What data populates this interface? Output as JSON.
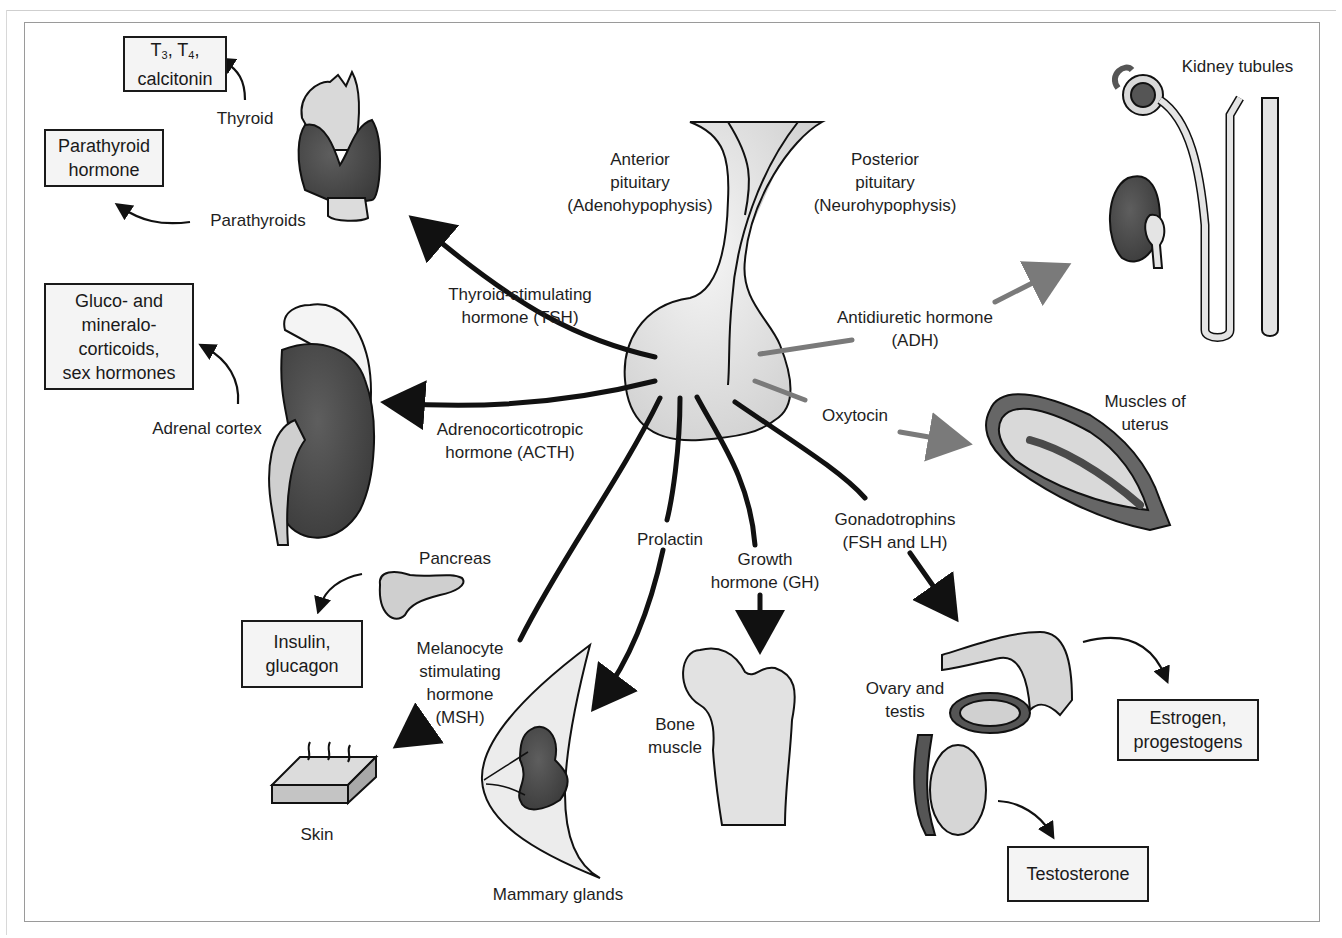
{
  "diagram": {
    "center": {
      "anterior": {
        "line1": "Anterior",
        "line2": "pituitary",
        "line3": "(Adenohypophysis)"
      },
      "posterior": {
        "line1": "Posterior",
        "line2": "pituitary",
        "line3": "(Neurohypophysis)"
      }
    },
    "hormones": {
      "tsh": {
        "line1": "Thyroid-stimulating",
        "line2": "hormone (TSH)"
      },
      "acth": {
        "line1": "Adrenocorticotropic",
        "line2": "hormone (ACTH)"
      },
      "msh": {
        "line1": "Melanocyte",
        "line2": "stimulating",
        "line3": "hormone",
        "line4": "(MSH)"
      },
      "prolactin": {
        "line1": "Prolactin"
      },
      "gh": {
        "line1": "Growth",
        "line2": "hormone (GH)"
      },
      "gonadotrophins": {
        "line1": "Gonadotrophins",
        "line2": "(FSH and LH)"
      },
      "adh": {
        "line1": "Antidiuretic hormone",
        "line2": "(ADH)"
      },
      "oxytocin": {
        "line1": "Oxytocin"
      }
    },
    "organs": {
      "thyroid": "Thyroid",
      "parathyroids": "Parathyroids",
      "adrenal": "Adrenal cortex",
      "pancreas": "Pancreas",
      "skin": "Skin",
      "mammary": "Mammary glands",
      "bone": {
        "line1": "Bone",
        "line2": "muscle"
      },
      "gonads": {
        "line1": "Ovary and",
        "line2": "testis"
      },
      "kidney": "Kidney tubules",
      "uterus": {
        "line1": "Muscles of",
        "line2": "uterus"
      }
    },
    "products": {
      "thyroid_box": {
        "t3": "T",
        "t3_sub": "3",
        "sep1": ", T",
        "t4_sub": "4",
        "sep2": ",",
        "line2": "calcitonin"
      },
      "parathyroid_box": {
        "line1": "Parathyroid",
        "line2": "hormone"
      },
      "adrenal_box": {
        "line1": "Gluco- and",
        "line2": "mineralo-",
        "line3": "corticoids,",
        "line4": "sex hormones"
      },
      "pancreas_box": {
        "line1": "Insulin,",
        "line2": "glucagon"
      },
      "ovary_box": {
        "line1": "Estrogen,",
        "line2": "progestogens"
      },
      "testis_box": {
        "line1": "Testosterone"
      }
    },
    "colors": {
      "anterior_arrow": "#111111",
      "posterior_arrow": "#7a7a7a",
      "organ_dark": "#4a4a4a",
      "organ_light": "#d9d9d9",
      "box_bg": "#f4f4f4"
    }
  }
}
